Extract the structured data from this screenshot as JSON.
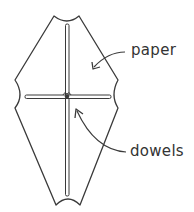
{
  "diagram": {
    "labels": {
      "paper": "paper",
      "dowels": "dowels"
    },
    "colors": {
      "stroke": "#3a3a3a",
      "background": "#ffffff",
      "text": "#333333"
    }
  }
}
